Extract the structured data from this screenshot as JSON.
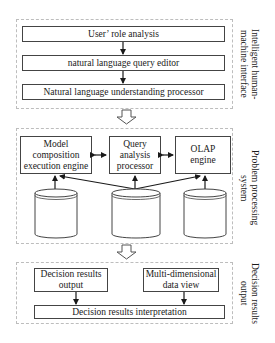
{
  "diagram": {
    "sections": [
      {
        "id": "interface",
        "side_label": "Intelligent human-\nmachine interface",
        "boxes": [
          "User’ role analysis",
          "natural language query editor",
          "Natural language understanding processor"
        ]
      },
      {
        "id": "processing",
        "side_label": "Problem processing\nsystem",
        "engines": [
          "Model\ncomposition\nexecution engine",
          "Query\nanalysis\nprocessor",
          "OLAP\nengine"
        ],
        "databases": [
          "Decision\nModel\nbase",
          "Domain\nknowledge\nbase",
          "Grain DW"
        ]
      },
      {
        "id": "output",
        "side_label": "Decision results\noutput",
        "boxes": [
          "Decision results\noutput",
          "Multi-dimensional\ndata view",
          "Decision results interpretation"
        ]
      }
    ],
    "colors": {
      "line": "#1a1a1a",
      "panel_border": "#bdbdbd",
      "box_border": "#444444"
    }
  }
}
